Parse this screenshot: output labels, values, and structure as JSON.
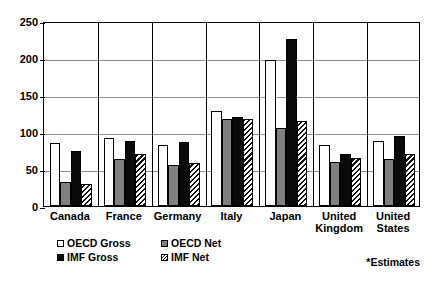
{
  "chart_data": {
    "type": "bar",
    "title": "",
    "xlabel": "",
    "ylabel": "",
    "ylim": [
      0,
      250
    ],
    "yticks": [
      0,
      50,
      100,
      150,
      200,
      250
    ],
    "grid": true,
    "legend_position": "bottom-left",
    "categories": [
      "Canada",
      "France",
      "Germany",
      "Italy",
      "Japan",
      "United Kingdom",
      "United States"
    ],
    "category_lines": [
      [
        "Canada"
      ],
      [
        "France"
      ],
      [
        "Germany"
      ],
      [
        "Italy"
      ],
      [
        "Japan"
      ],
      [
        "United",
        "Kingdom"
      ],
      [
        "United",
        "States"
      ]
    ],
    "series": [
      {
        "name": "OECD Gross",
        "fill": "white",
        "color": "#ffffff",
        "values": [
          85,
          92,
          82,
          128,
          197,
          83,
          88
        ]
      },
      {
        "name": "OECD Net",
        "fill": "gray",
        "color": "#808080",
        "values": [
          33,
          63,
          56,
          118,
          105,
          60,
          63
        ]
      },
      {
        "name": "IMF Gross",
        "fill": "black",
        "color": "#0a0a0a",
        "values": [
          75,
          88,
          86,
          120,
          226,
          70,
          95
        ]
      },
      {
        "name": "IMF Net",
        "fill": "hatched",
        "color": "#ffffff",
        "values": [
          30,
          70,
          58,
          117,
          115,
          65,
          70
        ]
      }
    ],
    "annotations": [
      "*Estimates"
    ]
  },
  "footnote": "*Estimates",
  "legend": {
    "items": [
      {
        "label": "OECD Gross",
        "swatch": "white-square-icon"
      },
      {
        "label": "OECD Net",
        "swatch": "gray-square-icon"
      },
      {
        "label": "IMF Gross",
        "swatch": "black-square-icon"
      },
      {
        "label": "IMF Net",
        "swatch": "hatched-square-icon"
      }
    ]
  }
}
